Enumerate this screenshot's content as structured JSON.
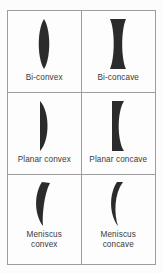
{
  "figure": {
    "background_color": "#fcfcfc",
    "border_color": "#9d9d9d",
    "lens_fill_color": "#2b2b2b",
    "label_color": "#3a3a3a",
    "columns": 2,
    "rows": 3
  },
  "cells": [
    {
      "id": "bi-convex",
      "label": "Bi-convex",
      "icon": "bi-convex-lens-icon",
      "row": 1,
      "column": 1
    },
    {
      "id": "bi-concave",
      "label": "Bi-concave",
      "icon": "bi-concave-lens-icon",
      "row": 1,
      "column": 2
    },
    {
      "id": "planar-convex",
      "label": "Planar convex",
      "icon": "planar-convex-lens-icon",
      "row": 2,
      "column": 1
    },
    {
      "id": "planar-concave",
      "label": "Planar concave",
      "icon": "planar-concave-lens-icon",
      "row": 2,
      "column": 2
    },
    {
      "id": "meniscus-convex",
      "label": "Meniscus\nconvex",
      "icon": "meniscus-convex-lens-icon",
      "row": 3,
      "column": 1
    },
    {
      "id": "meniscus-concave",
      "label": "Meniscus\nconcave",
      "icon": "meniscus-concave-lens-icon",
      "row": 3,
      "column": 2
    }
  ]
}
